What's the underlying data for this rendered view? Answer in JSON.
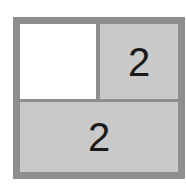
{
  "puzzle": {
    "cells": [
      {
        "id": "top-left",
        "value": "",
        "state": "empty"
      },
      {
        "id": "top-right",
        "value": "2",
        "state": "filled"
      },
      {
        "id": "bottom",
        "value": "2",
        "state": "filled"
      }
    ],
    "colors": {
      "border": "#8e8e8e",
      "filled": "#c9c9c9",
      "empty": "#ffffff",
      "text": "#1a1a1a"
    }
  }
}
